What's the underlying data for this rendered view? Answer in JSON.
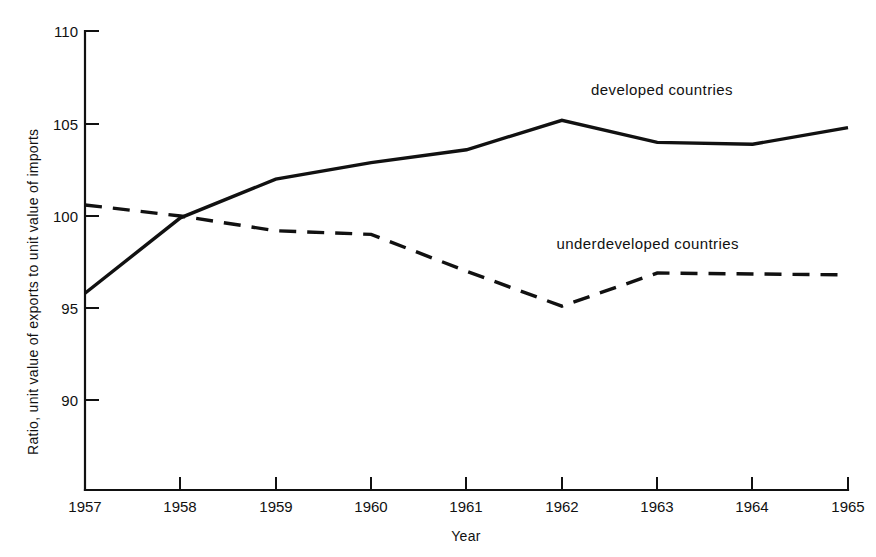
{
  "chart_data": {
    "type": "line",
    "title": "",
    "xlabel": "Year",
    "ylabel": "Ratio, unit value of exports to unit value of imports",
    "x": [
      1957,
      1958,
      1959,
      1960,
      1961,
      1962,
      1963,
      1964,
      1965
    ],
    "xticklabels": [
      "1957",
      "1958",
      "1959",
      "1960",
      "1961",
      "1962",
      "1963",
      "1964",
      "1965"
    ],
    "yticks": [
      90,
      95,
      100,
      105,
      110
    ],
    "yticklabels": [
      "90",
      "95",
      "100",
      "105",
      "110"
    ],
    "ylim": [
      85,
      110
    ],
    "xlim": [
      1957,
      1965
    ],
    "grid": false,
    "legend_position": "inline-annotations",
    "series": [
      {
        "name": "developed countries",
        "style": "solid",
        "color": "#111111",
        "values": [
          95.8,
          99.9,
          102.0,
          102.9,
          103.6,
          105.2,
          104.0,
          103.9,
          104.8
        ],
        "label_text": "developed countries",
        "label_x": 1963.05,
        "label_y": 106.6
      },
      {
        "name": "underdeveloped countries",
        "style": "dashed",
        "color": "#111111",
        "values": [
          100.6,
          100.0,
          99.2,
          99.0,
          97.0,
          95.1,
          96.9,
          96.85,
          96.8
        ],
        "label_text": "underdeveloped countries",
        "label_x": 1962.9,
        "label_y": 98.2
      }
    ]
  },
  "axes": {
    "y_axis_title": "Ratio, unit value of exports to unit value of imports",
    "x_axis_title": "Year"
  }
}
